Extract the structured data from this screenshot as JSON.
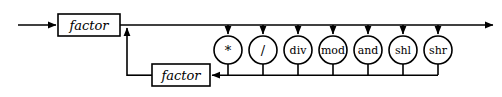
{
  "diagram": {
    "kind": "railroad-syntax-diagram",
    "canvas": {
      "width": 502,
      "height": 97,
      "background": "#ffffff"
    },
    "line_color": "#000000",
    "entry": {
      "name": "entry-arrow",
      "x1": 18,
      "y": 25,
      "x2": 58
    },
    "exit": {
      "name": "exit-arrow",
      "x1": 120,
      "y": 25,
      "x2": 495
    },
    "boxes": [
      {
        "id": "factor-first",
        "label": "factor",
        "x": 58,
        "y": 14,
        "width": 62,
        "height": 22,
        "cx": 89,
        "cy": 25
      },
      {
        "id": "factor-second",
        "label": "factor",
        "x": 152,
        "y": 64,
        "width": 58,
        "height": 22,
        "cx": 181,
        "cy": 75
      }
    ],
    "operators": [
      {
        "id": "op-mul",
        "label": "*",
        "cx": 228,
        "cy": 50,
        "r": 14,
        "symbol": true
      },
      {
        "id": "op-div",
        "label": "/",
        "cx": 263,
        "cy": 50,
        "r": 14,
        "symbol": true
      },
      {
        "id": "op-idiv",
        "label": "div",
        "cx": 298,
        "cy": 50,
        "r": 14,
        "symbol": false
      },
      {
        "id": "op-mod",
        "label": "mod",
        "cx": 333,
        "cy": 50,
        "r": 14,
        "symbol": false
      },
      {
        "id": "op-and",
        "label": "and",
        "cx": 368,
        "cy": 50,
        "r": 14,
        "symbol": false
      },
      {
        "id": "op-shl",
        "label": "shl",
        "cx": 403,
        "cy": 50,
        "r": 14,
        "symbol": false
      },
      {
        "id": "op-shr",
        "label": "shr",
        "cx": 438,
        "cy": 50,
        "r": 14,
        "symbol": false
      }
    ],
    "rails": {
      "top_y": 25,
      "bottom_y": 75,
      "merge_x": 127,
      "loop_left_x": 127,
      "loop_right_x": 438
    }
  }
}
